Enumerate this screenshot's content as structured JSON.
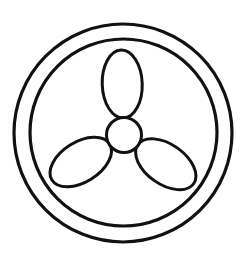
{
  "icon": {
    "name": "fan-icon",
    "label": "Fan symbol",
    "stroke_color": "#111111",
    "background_color": "#ffffff",
    "outer_ring": {
      "cx": 123,
      "cy": 133,
      "r": 109,
      "stroke_width": 3.2
    },
    "inner_ring": {
      "cx": 123.5,
      "cy": 132.5,
      "r": 93.5,
      "stroke_width": 3.2
    },
    "hub": {
      "cx": 124,
      "cy": 135,
      "r": 17.5,
      "stroke_width": 3
    },
    "blades": [
      {
        "name": "blade-top",
        "rotation_deg": -2
      },
      {
        "name": "blade-right",
        "rotation_deg": 125
      },
      {
        "name": "blade-left",
        "rotation_deg": 238
      }
    ],
    "blade_shape": {
      "offset": 51,
      "rx": 20,
      "ry": 34,
      "stroke_width": 3
    }
  }
}
